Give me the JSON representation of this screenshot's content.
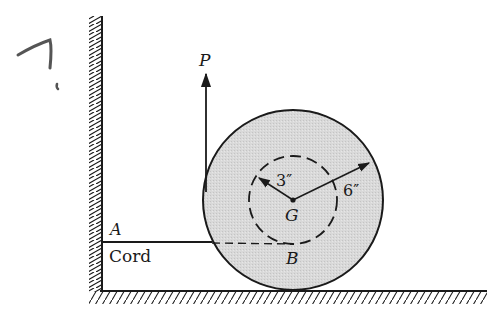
{
  "problem_number_annotation": "7.",
  "labels": {
    "force": "P",
    "anchor_point": "A",
    "cord": "Cord",
    "contact_point": "B",
    "center": "G",
    "inner_radius": "3″",
    "outer_radius": "6″"
  },
  "geometry": {
    "outer_radius_in": 6,
    "inner_radius_in": 3
  },
  "colors": {
    "disk_fill": "#d6d6d6",
    "stroke": "#1a1a1a",
    "pencil": "#555555"
  }
}
